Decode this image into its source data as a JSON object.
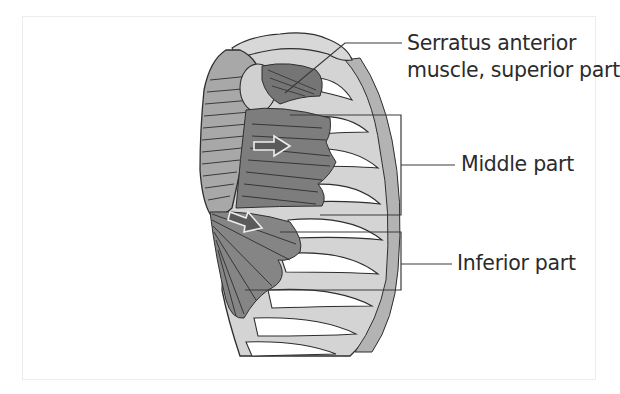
{
  "figure": {
    "title": "Serratus anterior muscle",
    "labels": {
      "serratus_line1": "Serratus anterior",
      "serratus_line2": "muscle, superior part",
      "middle": "Middle part",
      "inferior": "Inferior part"
    },
    "colors": {
      "background": "#ffffff",
      "frame_border": "#ececec",
      "outline": "#2e2e2e",
      "muscle_dark": "#6f6f6f",
      "muscle_mid": "#8c8c8c",
      "bone_light": "#cfcfcf",
      "cartilage": "#b3b3b3",
      "scapula": "#a8a8a8",
      "label_text": "#2b2b2b"
    },
    "arrows": [
      {
        "name": "middle-part-direction-arrow",
        "direction": "right"
      },
      {
        "name": "inferior-part-direction-arrow",
        "direction": "down-right"
      }
    ]
  }
}
